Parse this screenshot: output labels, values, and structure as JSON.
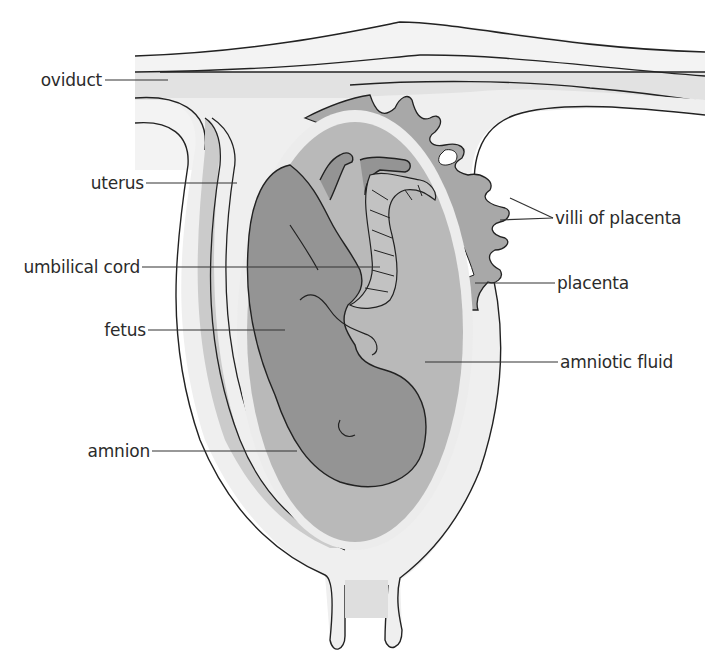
{
  "diagram": {
    "colors": {
      "background": "#ffffff",
      "outer_wall": "#f2f2f2",
      "uterine_tissue": "#e4e4e4",
      "muscle_band": "#c8c8c8",
      "amnion_band": "#efefef",
      "amniotic_fluid": "#b8b8b8",
      "fetus": "#939393",
      "placenta": "#a6a6a6",
      "outline": "#222222",
      "leader_line": "#333333"
    }
  },
  "labels": {
    "oviduct": "oviduct",
    "uterus": "uterus",
    "umbilical_cord": "umbilical cord",
    "fetus": "fetus",
    "amnion": "amnion",
    "villi_of_placenta": "villi of placenta",
    "placenta": "placenta",
    "amniotic_fluid": "amniotic fluid"
  }
}
